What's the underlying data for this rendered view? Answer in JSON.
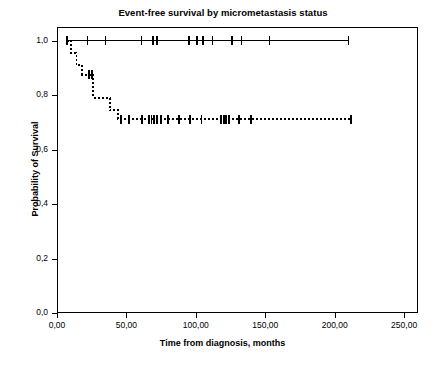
{
  "chart_data": {
    "type": "line",
    "subtype": "kaplan-meier-step",
    "title": "Event-free survival by micrometastasis status",
    "xlabel": "Time from diagnosis, months",
    "ylabel": "Probability of Survival",
    "xlim": [
      0,
      260
    ],
    "ylim": [
      0,
      1.05
    ],
    "xticks": [
      0,
      50,
      100,
      150,
      200,
      250
    ],
    "xtick_labels": [
      "0,00",
      "50,00",
      "100,00",
      "150,00",
      "200,00",
      "250,00"
    ],
    "yticks": [
      0.0,
      0.2,
      0.4,
      0.6,
      0.8,
      1.0
    ],
    "ytick_labels": [
      "0,0",
      "0,2",
      "0,4",
      "0,6",
      "0,8",
      "1,0"
    ],
    "grid": false,
    "legend": "none",
    "decimal_separator": "comma",
    "series": [
      {
        "name": "Micrometastasis negative",
        "style": "solid",
        "color": "#000000",
        "line_width": 1.6,
        "steps": [
          {
            "t": 7,
            "s": 1.0
          },
          {
            "t": 210,
            "s": 1.0
          }
        ],
        "censored": [
          7,
          22,
          35,
          61,
          69,
          72,
          95,
          101,
          105,
          112,
          126,
          133,
          153,
          210
        ],
        "final_survival": 1.0
      },
      {
        "name": "Micrometastasis positive",
        "style": "dashed",
        "color": "#000000",
        "line_width": 1.8,
        "dash_pattern": "2,2",
        "steps": [
          {
            "t": 7,
            "s": 1.0
          },
          {
            "t": 10,
            "s": 0.955
          },
          {
            "t": 14,
            "s": 0.91
          },
          {
            "t": 18,
            "s": 0.875
          },
          {
            "t": 26,
            "s": 0.875
          },
          {
            "t": 26,
            "s": 0.79
          },
          {
            "t": 38,
            "s": 0.79
          },
          {
            "t": 38,
            "s": 0.745
          },
          {
            "t": 44,
            "s": 0.745
          },
          {
            "t": 44,
            "s": 0.712
          },
          {
            "t": 212,
            "s": 0.712
          }
        ],
        "censored": [
          23,
          25,
          46,
          52,
          61,
          66,
          68,
          70,
          72,
          75,
          80,
          88,
          96,
          104,
          118,
          120,
          122,
          124,
          131,
          140,
          212
        ],
        "final_survival": 0.71
      }
    ]
  }
}
